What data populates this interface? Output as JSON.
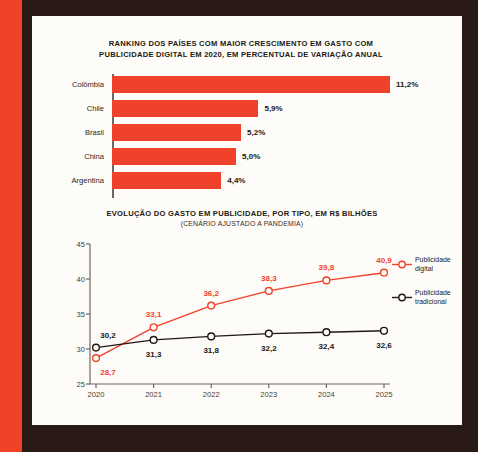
{
  "theme": {
    "accent_red": "#f0412b",
    "ink": "#231712",
    "frame_dark": "#2a1a16",
    "page_bg": "#fdfcf8",
    "stripe_orange": "#ef4226"
  },
  "bar_section": {
    "title_line1": "RANKING DOS PAÍSES COM MAIOR CRESCIMENTO EM GASTO COM",
    "title_line2": "PUBLICIDADE DIGITAL EM 2020, EM PERCENTUAL DE VARIAÇÃO ANUAL"
  },
  "line_section": {
    "title": "EVOLUÇÃO DO GASTO EM PUBLICIDADE, POR TIPO, EM R$ BILHÕES",
    "subtitle": "(CENÁRIO AJUSTADO A PANDEMIA)"
  },
  "chart_data": [
    {
      "type": "bar",
      "orientation": "horizontal",
      "title": "RANKING DOS PAÍSES COM MAIOR CRESCIMENTO EM GASTO COM PUBLICIDADE DIGITAL EM 2020, EM PERCENTUAL DE VARIAÇÃO ANUAL",
      "xlabel": "",
      "ylabel": "",
      "grid": false,
      "legend": "none",
      "unit": "%",
      "xlim": [
        0,
        11.2
      ],
      "categories": [
        "Colômbia",
        "Chile",
        "Brasil",
        "China",
        "Argentina"
      ],
      "values": [
        11.2,
        5.9,
        5.2,
        5.0,
        4.4
      ],
      "value_labels": [
        "11,2%",
        "5,9%",
        "5,2%",
        "5,0%",
        "4,4%"
      ],
      "color": "#f0412b"
    },
    {
      "type": "line",
      "title": "EVOLUÇÃO DO GASTO EM PUBLICIDADE, POR TIPO, EM R$ BILHÕES",
      "subtitle": "(CENÁRIO AJUSTADO A PANDEMIA)",
      "xlabel": "",
      "ylabel": "",
      "grid": false,
      "legend_position": "right",
      "x": [
        "2020",
        "2021",
        "2022",
        "2023",
        "2024",
        "2025"
      ],
      "ylim": [
        25,
        45
      ],
      "yticks": [
        25,
        30,
        35,
        40,
        45
      ],
      "ytick_labels": [
        "25",
        "30",
        "35",
        "40",
        "45"
      ],
      "series": [
        {
          "name": "Publicidade digital",
          "color": "#f0412b",
          "values": [
            28.7,
            33.1,
            36.2,
            38.3,
            39.8,
            40.9
          ],
          "value_labels": [
            "28,7",
            "33,1",
            "36,2",
            "38,3",
            "39,8",
            "40,9"
          ],
          "label_side": [
            "below",
            "above",
            "above",
            "above",
            "above",
            "above"
          ]
        },
        {
          "name": "Publicidade tradicional",
          "color": "#231712",
          "values": [
            30.2,
            31.3,
            31.8,
            32.2,
            32.4,
            32.6
          ],
          "value_labels": [
            "30,2",
            "31,3",
            "31,8",
            "32,2",
            "32,4",
            "32,6"
          ],
          "label_side": [
            "above",
            "below",
            "below",
            "below",
            "below",
            "below"
          ]
        }
      ]
    }
  ],
  "legend": {
    "items": [
      {
        "label_line1": "Publicidade",
        "label_line2": "digital",
        "color": "#f0412b",
        "marker": "circle-open"
      },
      {
        "label_line1": "Publicidade",
        "label_line2": "tradicional",
        "color": "#231712",
        "marker": "circle-open"
      }
    ]
  }
}
